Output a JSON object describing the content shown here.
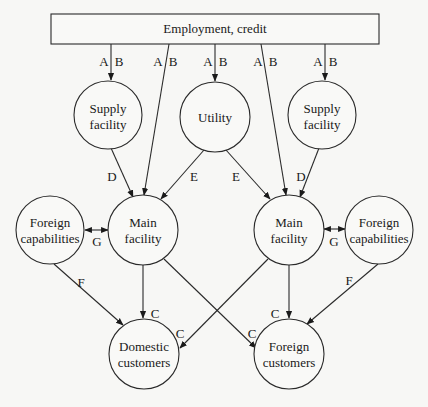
{
  "diagram": {
    "top_box": {
      "label": "Employment, credit"
    },
    "nodes": {
      "supply_left": {
        "line1": "Supply",
        "line2": "facility"
      },
      "utility": {
        "line1": "Utility"
      },
      "supply_right": {
        "line1": "Supply",
        "line2": "facility"
      },
      "foreign_cap_left": {
        "line1": "Foreign",
        "line2": "capabilities"
      },
      "main_left": {
        "line1": "Main",
        "line2": "facility"
      },
      "main_right": {
        "line1": "Main",
        "line2": "facility"
      },
      "foreign_cap_right": {
        "line1": "Foreign",
        "line2": "capabilities"
      },
      "domestic_customers": {
        "line1": "Domestic",
        "line2": "customers"
      },
      "foreign_customers": {
        "line1": "Foreign",
        "line2": "customers"
      }
    },
    "edge_labels": {
      "a": "A",
      "b": "B",
      "c": "C",
      "d": "D",
      "e": "E",
      "f": "F",
      "g": "G"
    }
  }
}
